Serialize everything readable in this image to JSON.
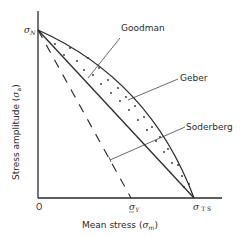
{
  "diagram": {
    "title": "",
    "colors": {
      "line": "#2a2a2a",
      "background": "#ffffff"
    },
    "axes": {
      "y_label": "Stress amplitude (σa)",
      "y_label_text": "Stress amplitude (",
      "y_label_sym": "σ",
      "y_label_sub": "a",
      "y_label_close": ")",
      "x_label_text": "Mean stress (",
      "x_label_sym": "σ",
      "x_label_sub": "m",
      "x_label_close": ")",
      "origin_label": "O"
    },
    "points": {
      "sigma_n": {
        "sym": "σ",
        "sub": "N"
      },
      "sigma_y": {
        "sym": "σ",
        "sub": "Y"
      },
      "sigma_ts": {
        "sym": "σ",
        "sub": "T S"
      }
    },
    "curves": [
      {
        "name": "Goodman",
        "style": "solid straight line",
        "from": "σN",
        "to": "σTS"
      },
      {
        "name": "Geber",
        "style": "solid parabola",
        "from": "σN",
        "to": "σTS"
      },
      {
        "name": "Soderberg",
        "style": "dashed straight line",
        "from": "σN",
        "to": "σY"
      }
    ],
    "labels": {
      "goodman": "Goodman",
      "geber": "Geber",
      "soderberg": "Soderberg"
    },
    "shaded_region": "dotted band between Goodman line and Geber curve"
  }
}
